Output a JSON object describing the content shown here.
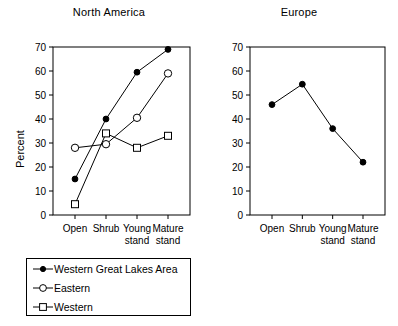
{
  "chart_data": [
    {
      "type": "line",
      "title": "North America",
      "xlabel": "",
      "ylabel": "Percent",
      "categories": [
        "Open",
        "Shrub",
        "Young stand",
        "Mature stand"
      ],
      "ylim": [
        0,
        70
      ],
      "yticks": [
        0,
        10,
        20,
        30,
        40,
        50,
        60,
        70
      ],
      "grid": false,
      "legend_position": "below",
      "series": [
        {
          "name": "Western Great Lakes Area",
          "marker": "filled-circle",
          "values": [
            15,
            40,
            59.5,
            69
          ]
        },
        {
          "name": "Eastern",
          "marker": "open-circle",
          "values": [
            28,
            29.5,
            40.5,
            59
          ]
        },
        {
          "name": "Western",
          "marker": "open-square",
          "values": [
            4.5,
            34,
            28,
            33
          ]
        }
      ]
    },
    {
      "type": "line",
      "title": "Europe",
      "xlabel": "",
      "ylabel": "",
      "categories": [
        "Open",
        "Shrub",
        "Young stand",
        "Mature stand"
      ],
      "ylim": [
        0,
        70
      ],
      "yticks": [
        0,
        10,
        20,
        30,
        40,
        50,
        60,
        70
      ],
      "grid": false,
      "legend_position": "none",
      "series": [
        {
          "name": "Europe",
          "marker": "filled-circle",
          "values": [
            46,
            54.5,
            36,
            22
          ]
        }
      ]
    }
  ],
  "panels": {
    "north_america": {
      "title": "North America",
      "ylabel": "Percent",
      "yticks": [
        "0",
        "10",
        "20",
        "30",
        "40",
        "50",
        "60",
        "70"
      ],
      "categories": [
        {
          "line1": "Open",
          "line2": ""
        },
        {
          "line1": "Shrub",
          "line2": ""
        },
        {
          "line1": "Young",
          "line2": "stand"
        },
        {
          "line1": "Mature",
          "line2": "stand"
        }
      ]
    },
    "europe": {
      "title": "Europe",
      "yticks": [
        "0",
        "10",
        "20",
        "30",
        "40",
        "50",
        "60",
        "70"
      ],
      "categories": [
        {
          "line1": "Open",
          "line2": ""
        },
        {
          "line1": "Shrub",
          "line2": ""
        },
        {
          "line1": "Young",
          "line2": "stand"
        },
        {
          "line1": "Mature",
          "line2": "stand"
        }
      ]
    }
  },
  "legend": {
    "items": [
      {
        "label": "Western Great Lakes Area",
        "marker": "filled-circle"
      },
      {
        "label": "Eastern",
        "marker": "open-circle"
      },
      {
        "label": "Western",
        "marker": "open-square"
      }
    ]
  },
  "colors": {
    "line": "#000000",
    "axis": "#000000",
    "background": "#ffffff",
    "marker_fill_open": "#ffffff"
  }
}
